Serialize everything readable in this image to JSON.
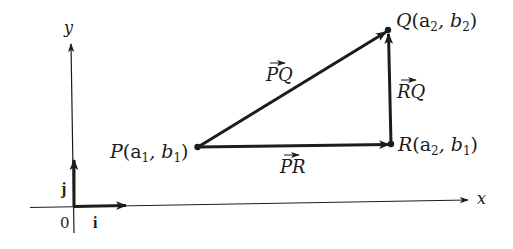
{
  "diagram": {
    "type": "vector-diagram",
    "colors": {
      "ink": "#1c1c1c",
      "background": "#ffffff"
    },
    "axes": {
      "x_label": "x",
      "y_label": "y",
      "origin_label": "0"
    },
    "unit_vectors": {
      "i_label": "i",
      "j_label": "j"
    },
    "points": {
      "P": {
        "name": "P",
        "coord_label": "(a",
        "sub1": "1",
        "sep": ", b",
        "sub2": "1",
        "close": ")"
      },
      "Q": {
        "name": "Q",
        "coord_label": "(a",
        "sub1": "2",
        "sep": ", b",
        "sub2": "2",
        "close": ")"
      },
      "R": {
        "name": "R",
        "coord_label": "(a",
        "sub1": "2",
        "sep": ", b",
        "sub2": "1",
        "close": ")"
      }
    },
    "vectors": {
      "PQ": {
        "label": "PQ",
        "from": "P",
        "to": "Q"
      },
      "RQ": {
        "label": "RQ",
        "from": "R",
        "to": "Q"
      },
      "PR": {
        "label": "PR",
        "from": "P",
        "to": "R"
      }
    }
  }
}
